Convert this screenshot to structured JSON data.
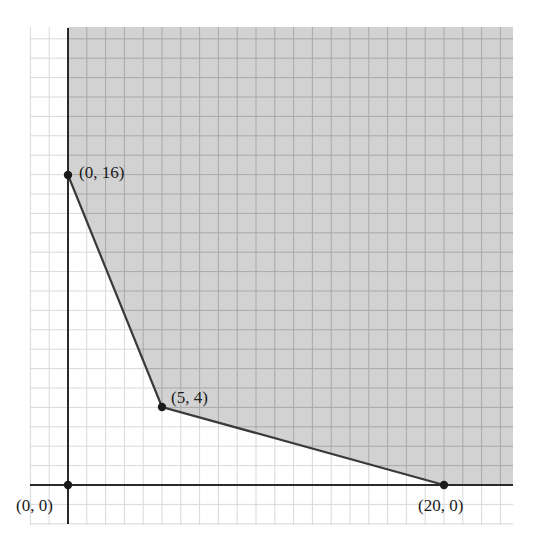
{
  "figure": {
    "type": "feasible-region-graph",
    "origin_px": [
      68,
      485
    ],
    "unit_px": {
      "x": 18.8,
      "y": 19.4
    },
    "grid": {
      "x_min": -2,
      "x_max": 23,
      "y_min": -2,
      "y_max": 23,
      "bounds_px": {
        "left": 30,
        "right": 513,
        "top": 27,
        "bottom": 525
      }
    },
    "colors": {
      "background": "#ffffff",
      "shade": "#d2d2d2",
      "grid_light": "#d9d9d9",
      "grid_shaded": "#a9a9a9",
      "axis": "#2a2a2a",
      "boundary": "#3a3a3a",
      "point": "#1a1a1a"
    },
    "vertices": [
      {
        "x": 0,
        "y": 16,
        "label": "(0, 16)"
      },
      {
        "x": 5,
        "y": 4,
        "label": "(5, 4)"
      },
      {
        "x": 20,
        "y": 0,
        "label": "(20, 0)"
      }
    ],
    "origin_point": {
      "x": 0,
      "y": 0,
      "label": "(0, 0)"
    }
  },
  "chart_data": {
    "type": "area",
    "title": "",
    "xlabel": "",
    "ylabel": "",
    "grid": true,
    "xlim": [
      -2,
      23.5
    ],
    "ylim": [
      -2,
      23.5
    ],
    "series": [
      {
        "name": "boundary",
        "x": [
          0,
          5,
          20
        ],
        "y": [
          16,
          4,
          0
        ]
      }
    ],
    "points": [
      {
        "x": 0,
        "y": 0,
        "label": "(0, 0)"
      },
      {
        "x": 0,
        "y": 16,
        "label": "(0, 16)"
      },
      {
        "x": 5,
        "y": 4,
        "label": "(5, 4)"
      },
      {
        "x": 20,
        "y": 0,
        "label": "(20, 0)"
      }
    ]
  }
}
